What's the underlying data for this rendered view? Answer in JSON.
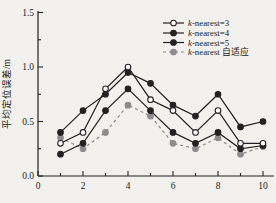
{
  "figure": {
    "background": "#f2f1ed",
    "ink_color": "#222222",
    "gray_color": "#8c8c8c"
  },
  "chart_data": {
    "type": "line",
    "title": "",
    "xlabel": "",
    "ylabel": "平均定位误差/m",
    "xlim": [
      0,
      10
    ],
    "ylim": [
      0,
      1.5
    ],
    "grid": false,
    "legend_position": "top-right",
    "x_ticks": [
      {
        "v": 0,
        "label": "0"
      },
      {
        "v": 1,
        "label": ""
      },
      {
        "v": 2,
        "label": "2"
      },
      {
        "v": 3,
        "label": ""
      },
      {
        "v": 4,
        "label": "4"
      },
      {
        "v": 5,
        "label": ""
      },
      {
        "v": 6,
        "label": "6"
      },
      {
        "v": 7,
        "label": ""
      },
      {
        "v": 8,
        "label": "8"
      },
      {
        "v": 9,
        "label": ""
      },
      {
        "v": 10,
        "label": "10"
      }
    ],
    "y_ticks": [
      {
        "v": 0,
        "label": "0.0"
      },
      {
        "v": 0.25,
        "label": ""
      },
      {
        "v": 0.5,
        "label": "0.5"
      },
      {
        "v": 0.75,
        "label": ""
      },
      {
        "v": 1.0,
        "label": "1.0"
      },
      {
        "v": 1.25,
        "label": ""
      },
      {
        "v": 1.5,
        "label": "1.5"
      }
    ],
    "x": [
      1,
      2,
      3,
      4,
      5,
      6,
      7,
      8,
      9,
      10
    ],
    "series": [
      {
        "name": "k-nearest=3",
        "marker": "open-circle",
        "line": "solid",
        "color": "#222222",
        "values": [
          0.3,
          0.4,
          0.8,
          1.0,
          0.7,
          0.6,
          0.4,
          0.6,
          0.3,
          0.3
        ]
      },
      {
        "name": "k-nearest=4",
        "marker": "filled-circle",
        "line": "solid",
        "color": "#222222",
        "values": [
          0.2,
          0.3,
          0.6,
          0.8,
          0.6,
          0.4,
          0.3,
          0.4,
          0.25,
          0.28
        ]
      },
      {
        "name": "k-nearest=5",
        "marker": "filled-circle",
        "line": "solid",
        "color": "#222222",
        "values": [
          0.4,
          0.6,
          0.75,
          0.95,
          0.85,
          0.65,
          0.55,
          0.75,
          0.45,
          0.5
        ]
      },
      {
        "name": "k-nearest 自适应",
        "marker": "filled-circle",
        "line": "dashed",
        "color": "#8c8c8c",
        "values": [
          0.35,
          0.25,
          0.4,
          0.65,
          0.55,
          0.3,
          0.25,
          0.35,
          0.2,
          0.27
        ]
      }
    ]
  }
}
